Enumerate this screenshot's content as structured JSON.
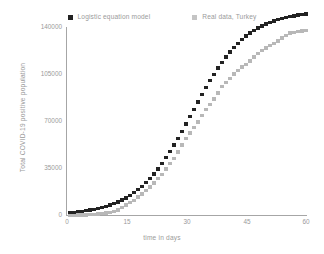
{
  "chart_data": {
    "type": "scatter",
    "title": "",
    "xlabel": "time in days",
    "ylabel": "Total COVID-19 positive population",
    "xlim": [
      0,
      60
    ],
    "ylim": [
      0,
      140000
    ],
    "grid": false,
    "legend_position": "top-center",
    "x_ticks": [
      "0",
      "15",
      "30",
      "45",
      "60"
    ],
    "x_tick_values": [
      0,
      15,
      30,
      45,
      60
    ],
    "y_ticks": [
      "0",
      "35000",
      "70000",
      "105000",
      "140000"
    ],
    "y_tick_values": [
      0,
      35000,
      70000,
      105000,
      140000
    ],
    "series": [
      {
        "name": "Logistic equation model",
        "color": "#222222",
        "marker": "square",
        "x": [
          1,
          2,
          3,
          4,
          5,
          6,
          7,
          8,
          9,
          10,
          11,
          12,
          13,
          14,
          15,
          16,
          17,
          18,
          19,
          20,
          21,
          22,
          23,
          24,
          25,
          26,
          27,
          28,
          29,
          30,
          31,
          32,
          33,
          34,
          35,
          36,
          37,
          38,
          39,
          40,
          41,
          42,
          43,
          44,
          45,
          46,
          47,
          48,
          49,
          50,
          51,
          52,
          53,
          54,
          55,
          56,
          57,
          58,
          59,
          60
        ],
        "values": [
          900,
          1050,
          1250,
          1500,
          1780,
          2110,
          2500,
          2960,
          3500,
          4140,
          4890,
          5770,
          6800,
          8010,
          9420,
          11070,
          12980,
          15200,
          17750,
          20680,
          24010,
          27790,
          32030,
          36760,
          41980,
          47700,
          53880,
          60480,
          67420,
          74590,
          81860,
          89090,
          96150,
          102920,
          109300,
          115210,
          120610,
          125470,
          129800,
          133630,
          136990,
          139910,
          142430,
          144600,
          146450,
          148020,
          149350,
          150470,
          151420,
          152210,
          152880,
          153440,
          153910,
          154300,
          154630,
          154900,
          155130,
          155320,
          155480,
          155610
        ],
        "values_scaled_note": "plotted values in plot capped near 138000 at day 60"
      },
      {
        "name": "Real data, Turkey",
        "color": "#b8b8b8",
        "marker": "square",
        "x": [
          1,
          2,
          3,
          4,
          5,
          6,
          7,
          8,
          9,
          10,
          11,
          12,
          13,
          14,
          15,
          16,
          17,
          18,
          19,
          20,
          21,
          22,
          23,
          24,
          25,
          26,
          27,
          28,
          29,
          30,
          31,
          32,
          33,
          34,
          35,
          36,
          37,
          38,
          39,
          40,
          41,
          42,
          43,
          44,
          45,
          46,
          47,
          48,
          49,
          50,
          51,
          52,
          53,
          54,
          55,
          56,
          57,
          58,
          59,
          60
        ],
        "values": [
          1,
          5,
          18,
          47,
          98,
          191,
          359,
          670,
          1236,
          1529,
          1872,
          2433,
          3629,
          5698,
          7402,
          9217,
          10827,
          13531,
          15679,
          18135,
          20921,
          23934,
          27069,
          30217,
          34109,
          38226,
          42282,
          47029,
          52167,
          56956,
          61049,
          65111,
          69392,
          74193,
          78546,
          82329,
          86306,
          90980,
          95591,
          98674,
          101790,
          104912,
          107773,
          110130,
          112261,
          114653,
          117589,
          120204,
          122392,
          124375,
          126045,
          127659,
          129491,
          131744,
          133721,
          135569,
          136107,
          136838,
          137115,
          137614
        ]
      }
    ]
  },
  "legend": {
    "entries": [
      {
        "label": "Logistic equation model",
        "swatch": "black-square-marker"
      },
      {
        "label": "Real data, Turkey",
        "swatch": "gray-square-marker"
      }
    ]
  },
  "axes": {
    "x_title": "time in days",
    "y_title": "Total COVID-19 positive population",
    "x_tick_labels": [
      "0",
      "15",
      "30",
      "45",
      "60"
    ],
    "y_tick_labels": [
      "0",
      "35000",
      "70000",
      "105000",
      "140000"
    ]
  },
  "colors": {
    "model": "#222222",
    "real": "#b8b8b8",
    "axis": "#a6a6a6",
    "text": "#9a9a9a",
    "background": "#ffffff"
  }
}
